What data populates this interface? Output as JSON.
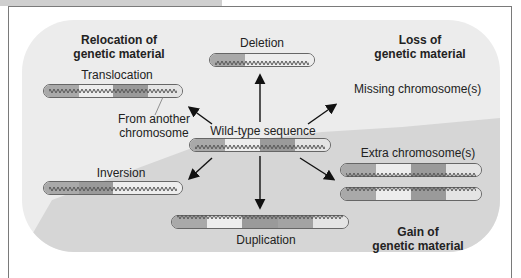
{
  "header": {
    "tab_visible": true
  },
  "categories": {
    "relocation": {
      "line1": "Relocation of",
      "line2": "genetic material"
    },
    "loss": {
      "line1": "Loss of",
      "line2": "genetic material"
    },
    "gain": {
      "line1": "Gain of",
      "line2": "genetic material"
    }
  },
  "center": {
    "label": "Wild-type sequence"
  },
  "mutations": {
    "deletion": "Deletion",
    "translocation": "Translocation",
    "from_another": {
      "line1": "From another",
      "line2": "chromosome"
    },
    "missing": "Missing chromosome(s)",
    "inversion": "Inversion",
    "extra": "Extra chromosome(s)",
    "duplication": "Duplication"
  },
  "colors": {
    "background": "#ececec",
    "gain_region": "#d4d4d4",
    "segment_dark": "#a9a9a9",
    "segment_light": "#ededed",
    "segment_medium": "#9a9a9a",
    "segment_pale": "#e4e4e4",
    "text": "#222222"
  }
}
